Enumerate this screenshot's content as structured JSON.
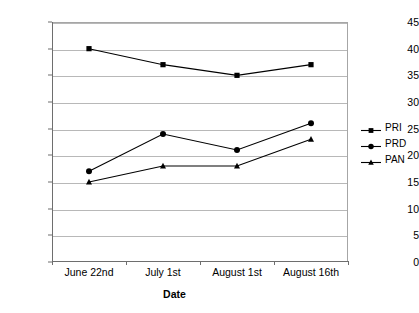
{
  "chart_data": {
    "type": "line",
    "title": "",
    "xlabel": "Date",
    "ylabel": "",
    "categories": [
      "June 22nd",
      "July 1st",
      "August 1st",
      "August 16th"
    ],
    "ylim": [
      0,
      45
    ],
    "yticks": [
      0,
      5,
      10,
      15,
      20,
      25,
      30,
      35,
      40,
      45
    ],
    "grid": "horizontal",
    "legend_position": "right",
    "series": [
      {
        "name": "PRI",
        "marker": "square",
        "color": "#000000",
        "values": [
          40,
          37,
          35,
          37
        ]
      },
      {
        "name": "PRD",
        "marker": "circle",
        "color": "#000000",
        "values": [
          17,
          24,
          21,
          26
        ]
      },
      {
        "name": "PAN",
        "marker": "triangle",
        "color": "#000000",
        "values": [
          15,
          18,
          18,
          23
        ]
      }
    ]
  },
  "axis": {
    "y_tick_labels": [
      "0",
      "5",
      "10",
      "15",
      "20",
      "25",
      "30",
      "35",
      "40",
      "45"
    ],
    "x_tick_labels": [
      "June 22nd",
      "July 1st",
      "August 1st",
      "August 16th"
    ],
    "x_title": "Date"
  },
  "legend": {
    "entries": [
      {
        "label": "PRI"
      },
      {
        "label": "PRD"
      },
      {
        "label": "PAN"
      }
    ]
  }
}
